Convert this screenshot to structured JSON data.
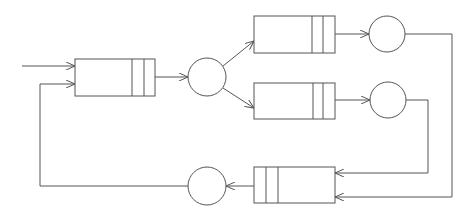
{
  "diagram": {
    "type": "queueing-network",
    "colors": {
      "line": "#555555",
      "background": "#ffffff"
    },
    "nodes": [
      {
        "id": "q1",
        "kind": "queue",
        "label": ""
      },
      {
        "id": "s1",
        "kind": "server",
        "label": ""
      },
      {
        "id": "q2",
        "kind": "queue",
        "label": ""
      },
      {
        "id": "s2",
        "kind": "server",
        "label": ""
      },
      {
        "id": "q3",
        "kind": "queue",
        "label": ""
      },
      {
        "id": "s3",
        "kind": "server",
        "label": ""
      },
      {
        "id": "q4",
        "kind": "queue",
        "label": ""
      },
      {
        "id": "s4",
        "kind": "server",
        "label": ""
      }
    ],
    "edges": [
      {
        "from": "external",
        "to": "q1"
      },
      {
        "from": "s4",
        "to": "q1"
      },
      {
        "from": "q1",
        "to": "s1"
      },
      {
        "from": "s1",
        "to": "q2"
      },
      {
        "from": "s1",
        "to": "q3"
      },
      {
        "from": "q2",
        "to": "s2"
      },
      {
        "from": "q3",
        "to": "s3"
      },
      {
        "from": "s2",
        "to": "q4"
      },
      {
        "from": "s3",
        "to": "q4"
      },
      {
        "from": "q4",
        "to": "s4"
      }
    ]
  }
}
